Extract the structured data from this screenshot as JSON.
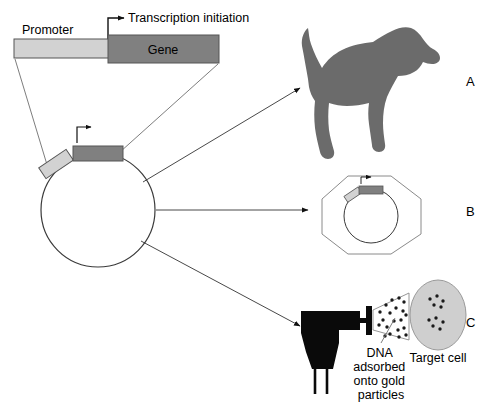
{
  "figure": {
    "background_color": "#ffffff"
  },
  "colors": {
    "promoter_fill": "#d2d2d2",
    "gene_fill": "#808080",
    "outline": "#555555",
    "dog_fill": "#6b6b6b",
    "gun_fill": "#0a0a0a",
    "target_cell_fill": "#cfcfcf",
    "particle_fill": "#1a1a1a",
    "leader_line": "#6e6e6e",
    "arrow": "#111111",
    "text": "#000000"
  },
  "construct": {
    "promoter_label": "Promoter",
    "gene_label": "Gene",
    "transcription_label": "Transcription initiation"
  },
  "plasmid": {
    "promoter_label": "Promoter",
    "gene_label": "Gene"
  },
  "panels": [
    {
      "id": "A",
      "label": "A",
      "caption": "Dog"
    },
    {
      "id": "B",
      "label": "B",
      "caption": "Cell with plasmid"
    },
    {
      "id": "C",
      "label": "C",
      "caption": "Gene gun"
    }
  ],
  "gene_gun": {
    "dna_label_lines": [
      "DNA",
      "adsorbed",
      "onto gold",
      "particles"
    ],
    "target_cell_label": "Target cell"
  }
}
